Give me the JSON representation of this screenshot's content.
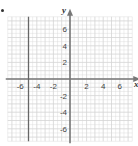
{
  "chart_data": {
    "type": "line",
    "title": "",
    "xlabel": "x",
    "ylabel": "y",
    "xlim": [
      -7.5,
      7.5
    ],
    "ylim": [
      -7.5,
      7.5
    ],
    "grid": true,
    "x_ticks": [
      "-6",
      "-4",
      "-2",
      "2",
      "4",
      "6"
    ],
    "y_ticks": [
      "6",
      "4",
      "2",
      "-2",
      "-4",
      "-6"
    ],
    "series": [
      {
        "name": "vertical line",
        "equation": "x = -5",
        "points": [
          [
            -5,
            -7.5
          ],
          [
            -5,
            7.5
          ]
        ]
      }
    ]
  },
  "colors": {
    "grid": "#d4d4d4",
    "axis": "#777777",
    "line": "#666666"
  },
  "labels": {
    "x_axis": "x",
    "y_axis": "y"
  }
}
